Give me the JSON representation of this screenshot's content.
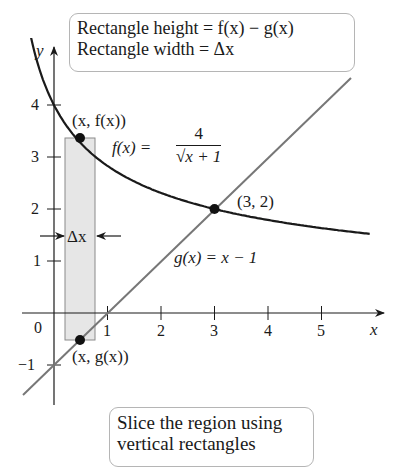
{
  "title_box": {
    "line1": "Rectangle height = f(x) − g(x)",
    "line2": "Rectangle width = Δx"
  },
  "caption_box": {
    "line1": "Slice the region using",
    "line2": "vertical rectangles"
  },
  "axes": {
    "x_label": "x",
    "y_label": "y",
    "origin_label": "0",
    "x_ticks": [
      "1",
      "2",
      "3",
      "4",
      "5"
    ],
    "y_ticks": [
      "−1",
      "1",
      "2",
      "3",
      "4"
    ]
  },
  "labels": {
    "point_f": "(x, f(x))",
    "point_g": "(x, g(x))",
    "intersection": "(3, 2)",
    "f_lhs": "f(x) =",
    "f_num": "4",
    "f_den": "√x + 1",
    "g_eq": "g(x) = x − 1",
    "delta_x": "Δx"
  },
  "colors": {
    "curve": "#1a1a1a",
    "line": "#777777",
    "rect_fill": "#e6e6e6",
    "rect_stroke": "#8a8a8a",
    "box_border": "#b5b5b5"
  },
  "chart_data": {
    "type": "line",
    "xlabel": "x",
    "ylabel": "y",
    "xlim": [
      -0.6,
      6.1
    ],
    "ylim": [
      -1.4,
      5.2
    ],
    "grid": false,
    "series": [
      {
        "name": "f(x) = 4/√(x+1)",
        "x": [
          -0.5,
          0,
          0.5,
          1,
          2,
          3,
          4,
          5,
          5.9
        ],
        "y": [
          5.66,
          4.0,
          3.27,
          2.83,
          2.31,
          2.0,
          1.79,
          1.63,
          1.52
        ]
      },
      {
        "name": "g(x) = x − 1",
        "x": [
          -0.4,
          5.5
        ],
        "y": [
          -1.4,
          4.5
        ]
      }
    ],
    "points": [
      {
        "label": "(x, f(x))",
        "x": 0.5,
        "y": 3.27
      },
      {
        "label": "(x, g(x))",
        "x": 0.5,
        "y": -0.5
      },
      {
        "label": "(3, 2)",
        "x": 3,
        "y": 2
      }
    ],
    "annotations": [
      "Rectangle height = f(x) − g(x)",
      "Rectangle width = Δx",
      "Δx",
      "Slice the region using vertical rectangles"
    ],
    "rectangle": {
      "x_from": 0.22,
      "x_to": 0.77,
      "y_from": -0.5,
      "y_to": 3.37
    }
  }
}
